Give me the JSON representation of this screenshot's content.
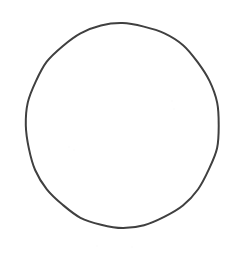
{
  "canvas": {
    "width": 245,
    "height": 254,
    "background_color": "#ffffff",
    "description": "Hand-drawn circle outline on blank white background"
  },
  "figure": {
    "shape_name": "circle-outline",
    "shape_type": "ellipse",
    "center_x": 122.5,
    "center_y": 125.5,
    "radius_x": 96.5,
    "radius_y": 102,
    "stroke_color": "#3f3f3f",
    "stroke_width": 2,
    "fill_color": "none",
    "bounds": {
      "left": 26,
      "top": 23.5,
      "right": 219,
      "bottom": 227.5
    }
  },
  "artifacts": {
    "label": "scan-specks",
    "color": "#fcfcfc",
    "items": [
      {
        "x": 68,
        "y": 146,
        "size": 2
      },
      {
        "x": 73,
        "y": 149,
        "size": 2
      },
      {
        "x": 171,
        "y": 100,
        "size": 2
      },
      {
        "x": 173,
        "y": 108,
        "size": 2
      },
      {
        "x": 96,
        "y": 245,
        "size": 2
      },
      {
        "x": 131,
        "y": 246,
        "size": 2
      }
    ]
  },
  "text": {
    "has_text": "false",
    "labels": []
  }
}
